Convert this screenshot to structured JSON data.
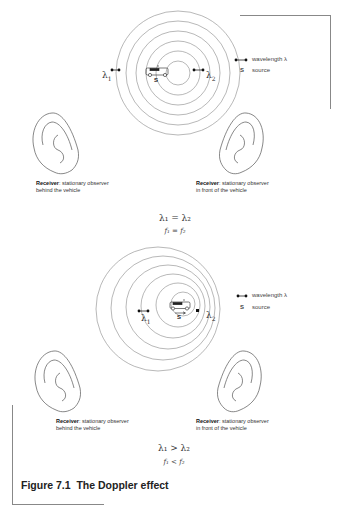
{
  "figure": {
    "title": "Figure 7.1  The Doppler effect"
  },
  "legend": {
    "wavelength_label": "wavelength λ",
    "source_symbol": "S",
    "source_label": "source"
  },
  "panel_top": {
    "lambda1": "λ",
    "lambda1_sub": "1",
    "lambda2": "λ",
    "lambda2_sub": "2",
    "source_label": "S",
    "receiver_left": {
      "bold": "Receiver",
      "text": ": stationary observer",
      "line2": "behind the vehicle"
    },
    "receiver_right": {
      "bold": "Receiver",
      "text": ": stationary observer",
      "line2": "in front of the vehicle"
    },
    "equation_lambda": "λ₁ = λ₂",
    "equation_freq": "f₁ = f₂"
  },
  "panel_bottom": {
    "lambda1": "λ",
    "lambda1_sub": "1",
    "lambda2": "λ",
    "lambda2_sub": "2",
    "source_label": "S",
    "receiver_left": {
      "bold": "Receiver",
      "text": ": stationary observer",
      "line2": "behind the vehicle"
    },
    "receiver_right": {
      "bold": "Receiver",
      "text": ": stationary observer",
      "line2": "in front of the vehicle"
    },
    "equation_lambda": "λ₁ > λ₂",
    "equation_freq": "f₁ < f₂"
  },
  "colors": {
    "line": "#777777",
    "frame": "#888888",
    "text": "#222222"
  }
}
